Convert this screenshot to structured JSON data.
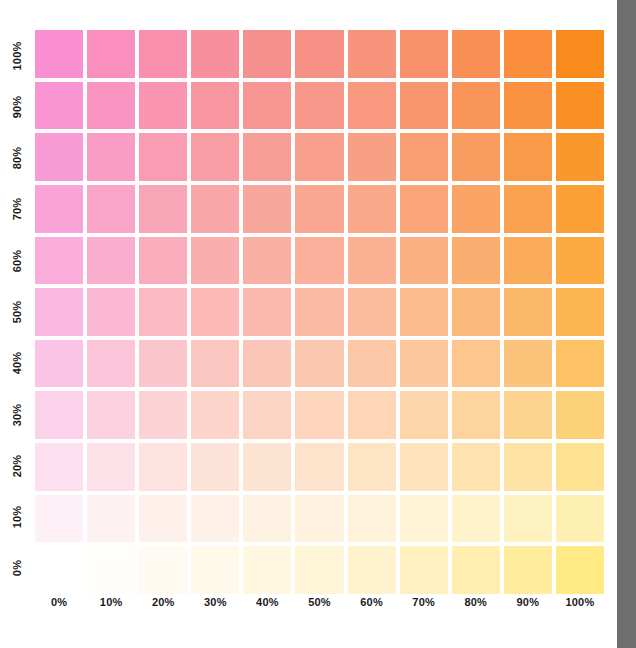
{
  "chart_data": {
    "type": "heatmap",
    "title": "",
    "xlabel": "",
    "ylabel": "",
    "x_tick_labels": [
      "0%",
      "10%",
      "20%",
      "30%",
      "40%",
      "50%",
      "60%",
      "70%",
      "80%",
      "90%",
      "100%"
    ],
    "y_tick_labels": [
      "100%",
      "90%",
      "80%",
      "70%",
      "60%",
      "50%",
      "40%",
      "30%",
      "20%",
      "10%",
      "0%"
    ],
    "x_values": [
      0,
      10,
      20,
      30,
      40,
      50,
      60,
      70,
      80,
      90,
      100
    ],
    "y_values": [
      100,
      90,
      80,
      70,
      60,
      50,
      40,
      30,
      20,
      10,
      0
    ],
    "xlim": [
      0,
      100
    ],
    "ylim": [
      0,
      100
    ],
    "grid": false,
    "legend": "none",
    "cell_gap_color": "#ffffff",
    "rows": [
      {
        "y_label": "100%",
        "colors": [
          "#f98ed0",
          "#fa8fbe",
          "#f98fad",
          "#f7909c",
          "#f6908f",
          "#f79185",
          "#f7937a",
          "#f8916a",
          "#f98f54",
          "#f98d3c",
          "#f98b1c"
        ]
      },
      {
        "y_label": "90%",
        "colors": [
          "#f994d2",
          "#fa95c1",
          "#f995b0",
          "#f8969f",
          "#f79693",
          "#f79789",
          "#f8987e",
          "#f8966e",
          "#f99459",
          "#fa9241",
          "#fa9023"
        ]
      },
      {
        "y_label": "80%",
        "colors": [
          "#f99bd5",
          "#fa9cc4",
          "#f99cb4",
          "#f89da3",
          "#f89e98",
          "#f89f8e",
          "#f8a083",
          "#f99e73",
          "#f99c5f",
          "#fa9a48",
          "#fa982b"
        ]
      },
      {
        "y_label": "70%",
        "colors": [
          "#f9a3d8",
          "#faa4c8",
          "#f9a5b8",
          "#f9a6a8",
          "#f9a69d",
          "#f9a793",
          "#f9a889",
          "#faa67a",
          "#faa466",
          "#fba250",
          "#fba034"
        ]
      },
      {
        "y_label": "60%",
        "colors": [
          "#faacdb",
          "#faaecd",
          "#faaebd",
          "#faafae",
          "#faafa4",
          "#fab09b",
          "#fab191",
          "#fab083",
          "#faae70",
          "#fbac5b",
          "#fbaa41"
        ]
      },
      {
        "y_label": "50%",
        "colors": [
          "#fab7e0",
          "#fbb8d2",
          "#fbb9c4",
          "#fbbab6",
          "#fbbaad",
          "#fbbba4",
          "#fbbc9b",
          "#fbbb8e",
          "#fbb97c",
          "#fbb769",
          "#fcb550"
        ]
      },
      {
        "y_label": "40%",
        "colors": [
          "#fbc3e5",
          "#fbc4d9",
          "#fbc5cc",
          "#fbc6c0",
          "#fbc6b8",
          "#fbc7b0",
          "#fcc8a7",
          "#fcc79c",
          "#fcc68c",
          "#fcc47a",
          "#fcc263"
        ]
      },
      {
        "y_label": "30%",
        "colors": [
          "#fcd1ea",
          "#fcd2e0",
          "#fcd3d5",
          "#fcd4ca",
          "#fcd4c3",
          "#fcd5bc",
          "#fcd6b5",
          "#fcd5ab",
          "#fdd49d",
          "#fdd28d",
          "#fdd178"
        ]
      },
      {
        "y_label": "20%",
        "colors": [
          "#fde0f0",
          "#fde1e8",
          "#fde2df",
          "#fde2d7",
          "#fde3d1",
          "#fde3cb",
          "#fde4c5",
          "#fee4bd",
          "#fee3b1",
          "#fee2a3",
          "#fee191"
        ]
      },
      {
        "y_label": "10%",
        "colors": [
          "#fef0f7",
          "#fef1f2",
          "#fef1ec",
          "#fef1e7",
          "#fef2e3",
          "#fef2df",
          "#fef3da",
          "#fef3d4",
          "#fef2cb",
          "#fef1c0",
          "#fef0b2"
        ]
      },
      {
        "y_label": "0%",
        "colors": [
          "#ffffff",
          "#fffdfa",
          "#fffbf2",
          "#fff9e9",
          "#fff7e0",
          "#fff5d7",
          "#fff3cd",
          "#fff0c0",
          "#ffeeaf",
          "#ffec9c",
          "#ffea86"
        ]
      }
    ]
  },
  "edge_strip": {
    "color": "#6e6e6e",
    "label": "page-edge-strip"
  },
  "page": {
    "background": "#ffffff"
  }
}
